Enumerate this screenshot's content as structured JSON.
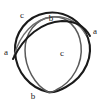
{
  "figure": {
    "background_color": "#ffffff",
    "width": 106,
    "height": 106
  },
  "colors": {
    "dark_stroke": "#1a1a1a",
    "mid_stroke": "#4a4a4a",
    "light_stroke": "#6e6e6e",
    "label_color": "#222222",
    "background": "#ffffff"
  },
  "labels": [
    {
      "id": "label-c-top-left",
      "text": "c",
      "x": 22,
      "y": 15
    },
    {
      "id": "label-b-top",
      "text": "b",
      "x": 51,
      "y": 18
    },
    {
      "id": "label-a-right",
      "text": "a",
      "x": 95,
      "y": 31
    },
    {
      "id": "label-a-left",
      "text": "a",
      "x": 6,
      "y": 52
    },
    {
      "id": "label-c-center",
      "text": "c",
      "x": 62,
      "y": 53
    },
    {
      "id": "label-b-bottom",
      "text": "b",
      "x": 33,
      "y": 96
    }
  ],
  "curves": [
    {
      "id": "curve-outer-dark",
      "role": "outer-teardrop-outline",
      "color": "#1a1a1a",
      "width": 2.1,
      "path": "M 48 92 C 30 88 16 72 15 52 C 14 33 27 16 46 13 C 66 10 82 22 88 38 C 94 55 86 76 66 87 C 59 91 53 93 48 92 Z"
    },
    {
      "id": "curve-inner-gray",
      "role": "inner-loop",
      "color": "#5a5a5a",
      "width": 1.5,
      "path": "M 48 92 C 35 85 25 68 25 50 C 25 33 36 19 51 17 C 67 15 79 28 81 45 C 83 63 73 82 56 90 C 53 92 50 93 48 92 Z"
    },
    {
      "id": "curve-top-arc-gray",
      "role": "top-arc",
      "color": "#6e6e6e",
      "width": 1.4,
      "path": "M 14 56 C 20 34 34 19 52 17 C 68 15 80 24 86 35"
    },
    {
      "id": "curve-sweep-dark",
      "role": "crossing-sweep",
      "color": "#1a1a1a",
      "width": 2.0,
      "path": "M 13 59 C 24 36 42 22 62 21 C 76 21 85 27 90 36"
    }
  ]
}
